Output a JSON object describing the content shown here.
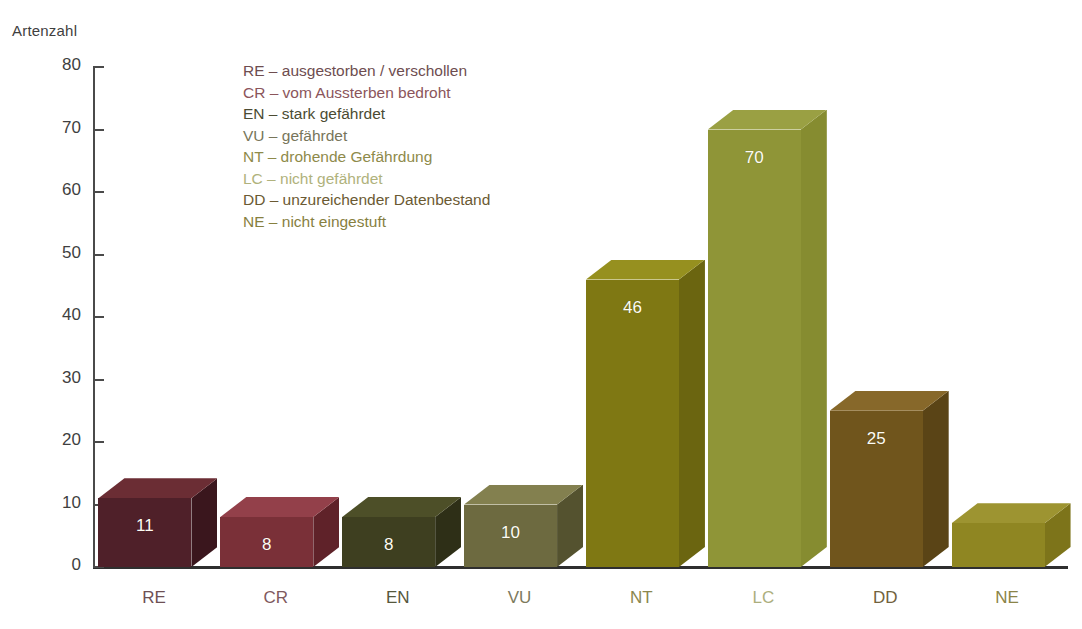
{
  "chart_data": {
    "type": "bar",
    "title": "",
    "ylabel": "Artenzahl",
    "xlabel": "",
    "ylim": [
      0,
      80
    ],
    "yticks": [
      0,
      10,
      20,
      30,
      40,
      50,
      60,
      70,
      80
    ],
    "grid": false,
    "legend_position": "inside-top-left",
    "categories": [
      "RE",
      "CR",
      "EN",
      "VU",
      "NT",
      "LC",
      "DD",
      "NE"
    ],
    "values": [
      11,
      8,
      8,
      10,
      46,
      70,
      25,
      7
    ],
    "value_labels": [
      "11",
      "8",
      "8",
      "10",
      "46",
      "70",
      "25",
      ""
    ],
    "bar_colors": [
      "#4f2029",
      "#7a3038",
      "#3e3f20",
      "#6d6a40",
      "#7f7813",
      "#8f9537",
      "#70551c",
      "#8f8622"
    ],
    "bar_top_colors": [
      "#6b2d34",
      "#93404a",
      "#4d4f28",
      "#83804f",
      "#96901f",
      "#9aa043",
      "#87682a",
      "#9d9431"
    ],
    "bar_side_colors": [
      "#3a161d",
      "#5f2229",
      "#2e2f17",
      "#54522f",
      "#6b6510",
      "#868c30",
      "#5a4416",
      "#7d741a"
    ],
    "annotations": [
      {
        "code": "RE",
        "text": "RE – ausgestorben / verschollen",
        "color": "#6e4d50"
      },
      {
        "code": "CR",
        "text": "CR – vom Aussterben bedroht",
        "color": "#8b555b"
      },
      {
        "code": "EN",
        "text": "EN – stark gefährdet",
        "color": "#4b4b33"
      },
      {
        "code": "VU",
        "text": "VU – gefährdet",
        "color": "#77755a"
      },
      {
        "code": "NT",
        "text": "NT – drohende Gefährdung",
        "color": "#8e8a4a"
      },
      {
        "code": "LC",
        "text": "LC – nicht gefährdet",
        "color": "#b0b27c"
      },
      {
        "code": "DD",
        "text": "DD – unzureichender Datenbestand",
        "color": "#6b5a33"
      },
      {
        "code": "NE",
        "text": "NE – nicht eingestuft",
        "color": "#87803f"
      }
    ],
    "category_label_colors": [
      "#6e5054",
      "#7f5a5e",
      "#56573c",
      "#7d7a5d",
      "#8b874e",
      "#acae7d",
      "#72623c",
      "#8b8448"
    ]
  },
  "axis": {
    "y_title": "Artenzahl"
  }
}
